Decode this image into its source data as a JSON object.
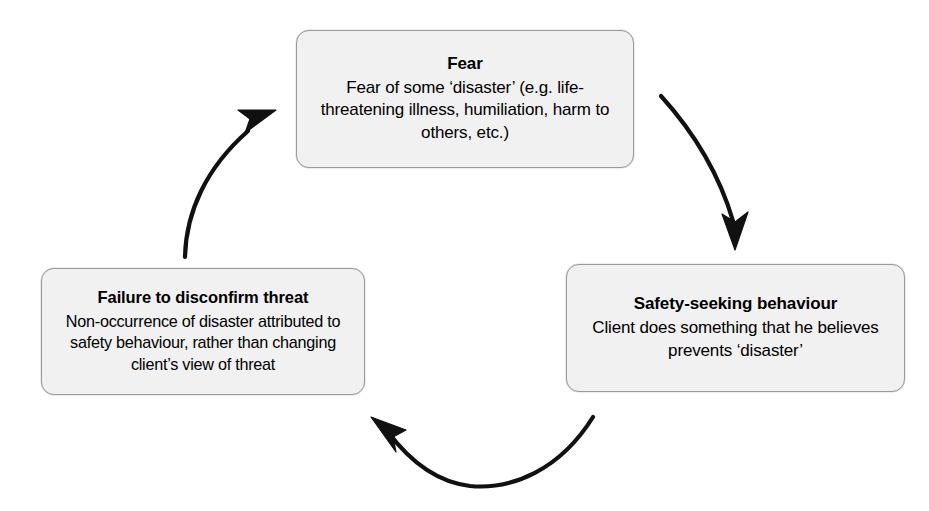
{
  "diagram": {
    "type": "cycle",
    "background_color": "#ffffff",
    "box_fill_color": "#f1f1f1",
    "box_border_color": "#9a9a9a",
    "arrow_color": "#111111",
    "nodes": [
      {
        "id": "fear",
        "title": "Fear",
        "body": "Fear of some ‘disaster’ (e.g. life-threatening illness, humiliation, harm to others, etc.)"
      },
      {
        "id": "safety",
        "title": "Safety-seeking behaviour",
        "body": "Client does something that he believes prevents ‘disaster’"
      },
      {
        "id": "failure",
        "title": "Failure to disconfirm threat",
        "body": "Non-occurrence of disaster attributed to safety behaviour, rather than changing client’s view of threat"
      }
    ],
    "arrows": [
      {
        "id": "fear-to-safety",
        "from": "fear",
        "to": "safety",
        "direction": "down-right"
      },
      {
        "id": "safety-to-failure",
        "from": "safety",
        "to": "failure",
        "direction": "left"
      },
      {
        "id": "failure-to-fear",
        "from": "failure",
        "to": "fear",
        "direction": "up-right"
      }
    ]
  }
}
